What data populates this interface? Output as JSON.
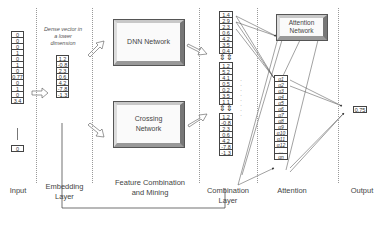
{
  "stages": [
    {
      "id": "input",
      "label": "Input"
    },
    {
      "id": "embedding",
      "label": "Embedding Layer"
    },
    {
      "id": "feature",
      "label": "Feature Combination and Mining"
    },
    {
      "id": "combination",
      "label": "Combination Layer"
    },
    {
      "id": "attention",
      "label": "Attention"
    },
    {
      "id": "output",
      "label": "Output"
    }
  ],
  "input_vector": [
    "0",
    "0",
    "0",
    "1",
    "0",
    "1",
    "0",
    "0.77",
    "0",
    "1",
    "0",
    "3.4"
  ],
  "input_vector_last": "0",
  "embedding": {
    "note": "Dense vector in a lower dimension",
    "values": [
      "1.2",
      "-0.8",
      "2.3",
      "0.6",
      "4.2",
      "-7.8",
      "-1.3"
    ]
  },
  "networks": {
    "dnn": "DNN Network",
    "crossing": "Crossing Network",
    "attention": "Attention Network"
  },
  "combination": {
    "dnn_part": [
      "1.4",
      "2.9",
      "2.3",
      "0.6",
      "4.2",
      "3.5",
      "0.4"
    ],
    "cross_part": [
      "1.2",
      "5.2",
      "4.1",
      "0.5",
      "0.2",
      "3.5",
      "1.1"
    ],
    "embed_part": [
      "1.2",
      "-0.8",
      "2.3",
      "0.6",
      "4.2",
      "-7.8",
      "-1.3"
    ]
  },
  "attention_weights": [
    "α1",
    "α2",
    "α3",
    "α4",
    "α5",
    "α6",
    "α7",
    "α8",
    "α9",
    "α10",
    "α11",
    "α12",
    "…",
    "αn"
  ],
  "output": {
    "value": "0.75"
  }
}
